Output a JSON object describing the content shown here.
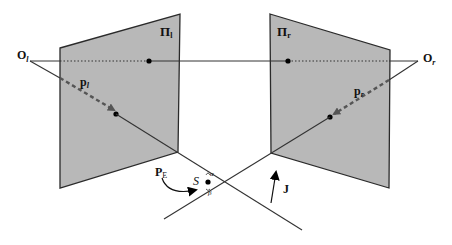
{
  "diagram": {
    "type": "stereo-geometry",
    "colors": {
      "plane_fill": "#b8b8b8",
      "plane_stroke": "#2a2a2a",
      "line": "#333333",
      "point": "#000000",
      "arrow": "#555555"
    },
    "labels": {
      "left_plane": {
        "main": "Π",
        "sub": "l"
      },
      "right_plane": {
        "main": "Π",
        "sub": "r"
      },
      "left_center": {
        "main": "O",
        "sub": "l"
      },
      "right_center": {
        "main": "O",
        "sub": "r"
      },
      "left_ray": {
        "main": "p",
        "sub": "l"
      },
      "right_ray": {
        "main": "p",
        "sub": "r"
      },
      "edge_point": {
        "main": "P",
        "sub": "E"
      },
      "surface": "S",
      "alpha": "α",
      "beta": "β",
      "junction": "J"
    },
    "elements": [
      "left image plane",
      "right image plane",
      "baseline through both centers (dotted inside planes)",
      "left projection ray (dashed inside plane)",
      "right projection ray (dashed inside plane)",
      "curved arrow from P_E to surface point",
      "arrow J"
    ]
  }
}
